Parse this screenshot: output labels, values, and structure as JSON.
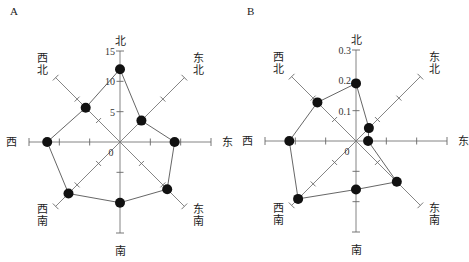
{
  "chart_data": [
    {
      "type": "radar",
      "panel_label": "A",
      "directions": [
        "北",
        "东北",
        "东",
        "东南",
        "南",
        "西南",
        "西",
        "西北"
      ],
      "direction_labels": {
        "north": "北",
        "northeast": [
          "东",
          "北"
        ],
        "east": "东",
        "southeast": [
          "东",
          "南"
        ],
        "south": "南",
        "southwest": [
          "西",
          "南"
        ],
        "west": "西",
        "northwest": [
          "西",
          "北"
        ]
      },
      "values": [
        12,
        5,
        9,
        11,
        10,
        12,
        12,
        8
      ],
      "rmax": 15,
      "tick_step": 5,
      "tick_labels": [
        "0",
        "5",
        "10",
        "15"
      ]
    },
    {
      "type": "radar",
      "panel_label": "B",
      "directions": [
        "北",
        "东北",
        "东",
        "东南",
        "南",
        "西南",
        "西",
        "西北"
      ],
      "direction_labels": {
        "north": "北",
        "northeast": [
          "东",
          "北"
        ],
        "east": "东",
        "southeast": [
          "东",
          "南"
        ],
        "south": "南",
        "southwest": [
          "西",
          "南"
        ],
        "west": "西",
        "northwest": [
          "西",
          "北"
        ]
      },
      "values": [
        0.19,
        0.06,
        0.04,
        0.19,
        0.16,
        0.27,
        0.22,
        0.18
      ],
      "rmax": 0.3,
      "tick_step": 0.1,
      "tick_labels": [
        "0",
        "0.1",
        "0.2",
        "0.3"
      ]
    }
  ]
}
